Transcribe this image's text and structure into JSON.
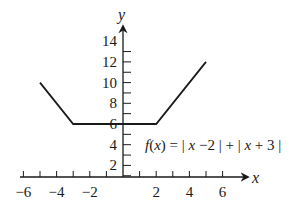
{
  "chart_data": {
    "type": "line",
    "title": "",
    "xlabel": "x",
    "ylabel": "y",
    "xlim": [
      -6,
      7
    ],
    "ylim": [
      0,
      15
    ],
    "grid": false,
    "legend": null,
    "x_ticks": [
      -6,
      -5,
      -4,
      -3,
      -2,
      -1,
      0,
      1,
      2,
      3,
      4,
      5,
      6
    ],
    "x_tick_labels": [
      "−6",
      "−4",
      "−2",
      "2",
      "4",
      "6"
    ],
    "x_tick_label_values": [
      -6,
      -4,
      -2,
      2,
      4,
      6
    ],
    "y_ticks": [
      1,
      2,
      3,
      4,
      5,
      6,
      7,
      8,
      9,
      10,
      11,
      12,
      13
    ],
    "y_tick_labels": [
      "2",
      "4",
      "6",
      "8",
      "10",
      "12",
      "14"
    ],
    "y_tick_label_values": [
      2,
      4,
      6,
      8,
      10,
      12,
      14
    ],
    "annotations": [
      {
        "text": "f(x) = | x −2 | + | x + 3 |",
        "x": 1.5,
        "y": 4
      }
    ],
    "series": [
      {
        "name": "f(x) = |x − 2| + |x + 3|",
        "x": [
          -5,
          -3,
          2,
          5
        ],
        "y": [
          10,
          6,
          6,
          12
        ]
      }
    ]
  }
}
